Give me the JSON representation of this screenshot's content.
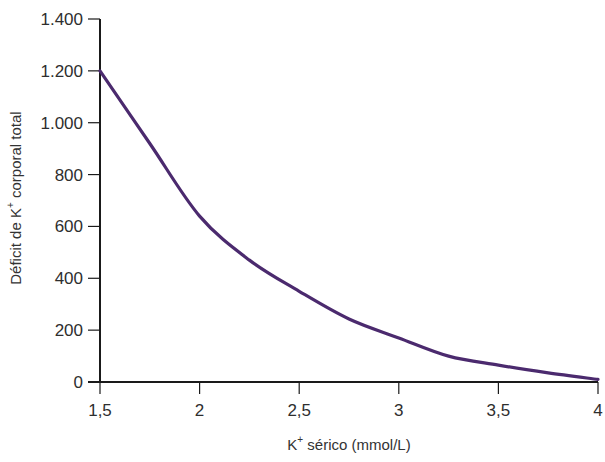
{
  "chart_data": {
    "type": "line",
    "title": "",
    "xlabel": "K+ sérico (mmol/L)",
    "xlabel_parts": {
      "base": "K",
      "sup": "+",
      "rest": " sérico (mmol/L)"
    },
    "ylabel": "Déficit de K+ corporal total",
    "ylabel_parts": {
      "base": "Déficit de K",
      "sup": "+",
      "rest": " corporal total"
    },
    "xlim": [
      1.5,
      4
    ],
    "ylim": [
      0,
      1400
    ],
    "x_ticks": [
      1.5,
      2,
      2.5,
      3,
      3.5,
      4
    ],
    "x_tick_labels": [
      "1,5",
      "2",
      "2,5",
      "3",
      "3,5",
      "4"
    ],
    "y_ticks": [
      0,
      200,
      400,
      600,
      800,
      1000,
      1200,
      1400
    ],
    "y_tick_labels": [
      "0",
      "200",
      "400",
      "600",
      "800",
      "1.000",
      "1.200",
      "1.400"
    ],
    "grid": false,
    "legend": null,
    "series": [
      {
        "name": "Déficit de K+ corporal total",
        "color": "#4b2a6e",
        "x": [
          1.5,
          1.75,
          2.0,
          2.25,
          2.5,
          2.75,
          3.0,
          3.25,
          3.5,
          3.75,
          4.0
        ],
        "values": [
          1200,
          920,
          640,
          470,
          350,
          243,
          170,
          100,
          65,
          35,
          10
        ]
      }
    ]
  },
  "colors": {
    "axis": "#1a1a1a",
    "curve": "#4b2a6e",
    "text": "#2e2e2e"
  }
}
